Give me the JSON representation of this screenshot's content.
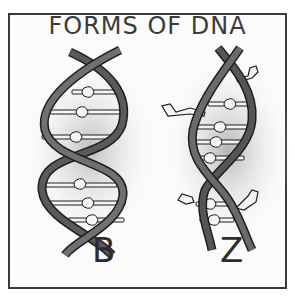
{
  "figure": {
    "title": "FORMS OF DNA",
    "panels": [
      {
        "form": "B",
        "label": "B",
        "description": "right-handed double helix, smooth regular twist, base pairs drawn as knotted rungs"
      },
      {
        "form": "Z",
        "label": "Z",
        "description": "left-handed zig-zag helix, narrower, with protruding side groups"
      }
    ]
  },
  "colors": {
    "frame": "#3a3a3a",
    "strand_dark": "#4a4a4a",
    "strand_outline": "#1e1e1e",
    "rung": "#f4f4f4",
    "shadow": "#c8c8c8",
    "text": "#3c3c3c"
  }
}
